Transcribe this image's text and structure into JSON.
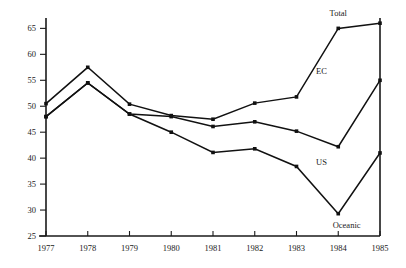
{
  "chart_data": {
    "type": "line",
    "title": "",
    "subtitle": "",
    "xlabel": "",
    "ylabel": "",
    "x": [
      1977,
      1978,
      1979,
      1980,
      1981,
      1982,
      1983,
      1984,
      1985
    ],
    "categories": [
      "1977",
      "1978",
      "1979",
      "1980",
      "1981",
      "1982",
      "1983",
      "1984",
      "1985"
    ],
    "xlim": [
      1977,
      1985
    ],
    "ylim": [
      25,
      67
    ],
    "yticks": [
      25,
      30,
      35,
      40,
      45,
      50,
      55,
      60,
      65
    ],
    "ytick_labels": [
      "25",
      "30",
      "35",
      "40",
      "45",
      "50",
      "55",
      "60",
      "65"
    ],
    "xtick_labels": [
      "1977",
      "1978",
      "1979",
      "1980",
      "1981",
      "1982",
      "1983",
      "1984",
      "1985"
    ],
    "grid": false,
    "legend_position": "inline-annotations",
    "series": [
      {
        "name": "Total",
        "values": [
          50.5,
          57.5,
          50.4,
          48.2,
          47.5,
          50.6,
          51.8,
          65.0,
          66.0
        ]
      },
      {
        "name": "EC",
        "values": [
          48.0,
          54.5,
          48.5,
          48.0,
          46.1,
          47.0,
          45.2,
          42.2,
          55.0
        ]
      },
      {
        "name": "Oceanic",
        "values": [
          48.0,
          54.5,
          48.5,
          45.0,
          41.1,
          41.8,
          38.4,
          29.3,
          41.0
        ]
      }
    ],
    "annotations": [
      {
        "text": "Total",
        "x": 1984.0,
        "y": 67.3
      },
      {
        "text": "EC",
        "x": 1983.6,
        "y": 56.2
      },
      {
        "text": "US",
        "x": 1983.6,
        "y": 38.6
      },
      {
        "text": "Oceanic",
        "x": 1984.2,
        "y": 26.5
      }
    ],
    "colors": {
      "line": "#111111",
      "axis": "#1a1a1a",
      "background": "#ffffff",
      "text": "#1a1a1a"
    }
  }
}
